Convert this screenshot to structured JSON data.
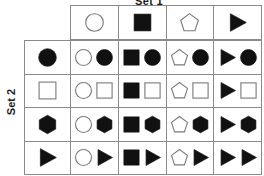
{
  "labels": {
    "top_set": "Set 1",
    "side_set": "Set 2"
  },
  "colors": {
    "fill_dark": "#111111",
    "fill_light": "#ffffff",
    "outline": "#7a7a7a",
    "grid_line": "#8a8a8a",
    "text": "#1a1a1a"
  },
  "matrix": {
    "column_headers": [
      {
        "shape": "circle",
        "fill": "white",
        "name": "white-circle"
      },
      {
        "shape": "square",
        "fill": "black",
        "name": "black-square"
      },
      {
        "shape": "pentagon",
        "fill": "white",
        "name": "white-pentagon"
      },
      {
        "shape": "triangle",
        "fill": "black",
        "name": "black-triangle"
      }
    ],
    "row_headers": [
      {
        "shape": "circle",
        "fill": "black",
        "name": "black-circle"
      },
      {
        "shape": "square",
        "fill": "white",
        "name": "white-square"
      },
      {
        "shape": "hexagon",
        "fill": "black",
        "name": "black-hexagon"
      },
      {
        "shape": "triangle",
        "fill": "black",
        "name": "black-triangle"
      }
    ],
    "cells": [
      [
        {
          "shapes": [
            {
              "shape": "circle",
              "fill": "white"
            },
            {
              "shape": "circle",
              "fill": "black"
            }
          ]
        },
        {
          "shapes": [
            {
              "shape": "square",
              "fill": "black"
            },
            {
              "shape": "circle",
              "fill": "black"
            }
          ]
        },
        {
          "shapes": [
            {
              "shape": "pentagon",
              "fill": "white"
            },
            {
              "shape": "circle",
              "fill": "black"
            }
          ]
        },
        {
          "shapes": [
            {
              "shape": "triangle",
              "fill": "black"
            },
            {
              "shape": "circle",
              "fill": "black"
            }
          ]
        }
      ],
      [
        {
          "shapes": [
            {
              "shape": "circle",
              "fill": "white"
            },
            {
              "shape": "square",
              "fill": "white"
            }
          ]
        },
        {
          "shapes": [
            {
              "shape": "square",
              "fill": "black"
            },
            {
              "shape": "square",
              "fill": "white"
            }
          ]
        },
        {
          "shapes": [
            {
              "shape": "pentagon",
              "fill": "white"
            },
            {
              "shape": "square",
              "fill": "white"
            }
          ]
        },
        {
          "shapes": [
            {
              "shape": "triangle",
              "fill": "black"
            },
            {
              "shape": "square",
              "fill": "white"
            }
          ]
        }
      ],
      [
        {
          "shapes": [
            {
              "shape": "circle",
              "fill": "white"
            },
            {
              "shape": "hexagon",
              "fill": "black"
            }
          ]
        },
        {
          "shapes": [
            {
              "shape": "square",
              "fill": "black"
            },
            {
              "shape": "hexagon",
              "fill": "black"
            }
          ]
        },
        {
          "shapes": [
            {
              "shape": "pentagon",
              "fill": "white"
            },
            {
              "shape": "hexagon",
              "fill": "black"
            }
          ]
        },
        {
          "shapes": [
            {
              "shape": "triangle",
              "fill": "black"
            },
            {
              "shape": "hexagon",
              "fill": "black"
            }
          ]
        }
      ],
      [
        {
          "shapes": [
            {
              "shape": "circle",
              "fill": "white"
            },
            {
              "shape": "triangle",
              "fill": "black"
            }
          ]
        },
        {
          "shapes": [
            {
              "shape": "square",
              "fill": "black"
            },
            {
              "shape": "triangle",
              "fill": "black"
            }
          ]
        },
        {
          "shapes": [
            {
              "shape": "pentagon",
              "fill": "white"
            },
            {
              "shape": "triangle",
              "fill": "black"
            }
          ]
        },
        {
          "shapes": [
            {
              "shape": "triangle",
              "fill": "black"
            },
            {
              "shape": "triangle",
              "fill": "black"
            }
          ]
        }
      ]
    ]
  }
}
